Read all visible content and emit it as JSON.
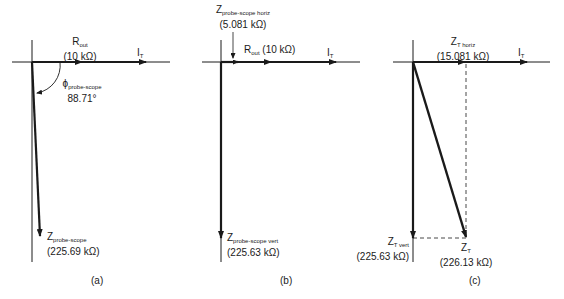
{
  "panels": [
    {
      "caption": "(a)",
      "rout": {
        "main": "R",
        "sub": "out",
        "value": "(10 kΩ)"
      },
      "it": {
        "main": "I",
        "sub": "T"
      },
      "phi": {
        "main": "ϕ",
        "sub": "probe-scope",
        "value": "88.71°"
      },
      "z": {
        "main": "Z",
        "sub": "probe-scope",
        "value": "(225.69 kΩ)"
      }
    },
    {
      "caption": "(b)",
      "zh": {
        "main": "Z",
        "sub": "probe-scope horiz",
        "value": "(5.081 kΩ)"
      },
      "rout": {
        "main": "R",
        "sub": "out",
        "value": "(10 kΩ)"
      },
      "it": {
        "main": "I",
        "sub": "T"
      },
      "zv": {
        "main": "Z",
        "sub": "probe-scope vert",
        "value": "(225.63 kΩ)"
      }
    },
    {
      "caption": "(c)",
      "zh": {
        "main": "Z",
        "sub": "T horiz",
        "value": "(15.081 kΩ)"
      },
      "it": {
        "main": "I",
        "sub": "T"
      },
      "zv": {
        "main": "Z",
        "sub": "T vert",
        "value": "(225.63 kΩ)"
      },
      "zt": {
        "main": "Z",
        "sub": "T",
        "value": "(226.13 kΩ)"
      }
    }
  ]
}
